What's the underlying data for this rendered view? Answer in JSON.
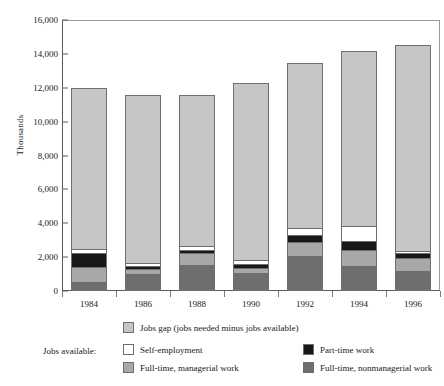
{
  "chart_data": {
    "type": "bar",
    "subtype": "stacked-vertical",
    "title": "",
    "xlabel": "",
    "ylabel": "Thousands",
    "ylim": [
      0,
      16000
    ],
    "ytick_labels": [
      "16,000",
      "14,000",
      "12,000",
      "10,000",
      "8,000",
      "6,000",
      "4,000",
      "2,000",
      "0"
    ],
    "ytick_values": [
      16000,
      14000,
      12000,
      10000,
      8000,
      6000,
      4000,
      2000,
      0
    ],
    "grid": false,
    "legend_position": "bottom",
    "categories": [
      "1984",
      "1986",
      "1988",
      "1990",
      "1992",
      "1994",
      "1996"
    ],
    "series": [
      {
        "name": "Full-time, nonmanagerial work",
        "color": "#6e6e6e",
        "values": [
          500,
          950,
          1480,
          1000,
          2050,
          1450,
          1150
        ]
      },
      {
        "name": "Full-time, managerial work",
        "color": "#a8a8a8",
        "values": [
          900,
          300,
          720,
          330,
          780,
          900,
          730
        ]
      },
      {
        "name": "Part-time work",
        "color": "#181818",
        "values": [
          800,
          180,
          200,
          190,
          450,
          570,
          300
        ]
      },
      {
        "name": "Self-employment",
        "color": "#ffffff",
        "values": [
          250,
          150,
          220,
          260,
          440,
          880,
          120
        ]
      },
      {
        "name": "Jobs gap (jobs needed minus jobs available)",
        "color": "#c6c6c6",
        "values": [
          9550,
          10020,
          8950,
          10520,
          9760,
          10350,
          12220
        ]
      }
    ],
    "totals": [
      12000,
      11600,
      11570,
      12300,
      13480,
      14150,
      14520
    ],
    "annotations": []
  },
  "legend": {
    "gap_label": "Jobs gap (jobs needed minus jobs available)",
    "available_label": "Jobs available:",
    "self_employment_label": "Self-employment",
    "part_time_label": "Part-time work",
    "full_time_managerial_label": "Full-time, managerial work",
    "full_time_nonmanagerial_label": "Full-time, nonmanagerial work"
  },
  "axis": {
    "y_title": "Thousands",
    "y_labels": [
      "16,000",
      "14,000",
      "12,000",
      "10,000",
      "8,000",
      "6,000",
      "4,000",
      "2,000",
      "0"
    ],
    "x_labels": [
      "1984",
      "1986",
      "1988",
      "1990",
      "1992",
      "1994",
      "1996"
    ]
  },
  "colors": {
    "jobs_gap": "#c6c6c6",
    "self_employment": "#ffffff",
    "part_time": "#181818",
    "full_time_managerial": "#a8a8a8",
    "full_time_nonmanagerial": "#6e6e6e",
    "axis": "#5a5a5a",
    "background": "#ffffff"
  }
}
